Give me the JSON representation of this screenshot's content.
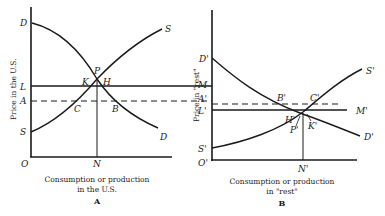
{
  "panel_a": {
    "panel_label": "A",
    "y_axis_title": "Price in the U.S.",
    "x_axis_title_line1": "Consumption or production",
    "x_axis_title_line2": "in the U.S.",
    "labels": {
      "origin": "O",
      "demand_start": "D",
      "demand_end": "D",
      "supply_start": "S",
      "supply_end": "S",
      "line_l": "L",
      "line_a": "A",
      "point_p": "P",
      "point_k": "K",
      "point_h": "H",
      "point_c": "C",
      "point_b": "B",
      "point_n": "N"
    }
  },
  "panel_b": {
    "panel_label": "B",
    "y_axis_title": "Price in \"rest\"",
    "x_axis_title_line1": "Consumption or production",
    "x_axis_title_line2": "in \"rest\"",
    "labels": {
      "origin": "O'",
      "demand_start": "D'",
      "demand_end": "D'",
      "supply_start": "S'",
      "supply_end": "S'",
      "line_m": "M",
      "line_m_prime": "M'",
      "line_a_prime": "A'",
      "line_l_prime": "L'",
      "point_b_prime": "B'",
      "point_c_prime": "C'",
      "point_h_prime": "H'",
      "point_p_prime": "P'",
      "point_k_prime": "K'",
      "point_n_prime": "N'"
    }
  }
}
